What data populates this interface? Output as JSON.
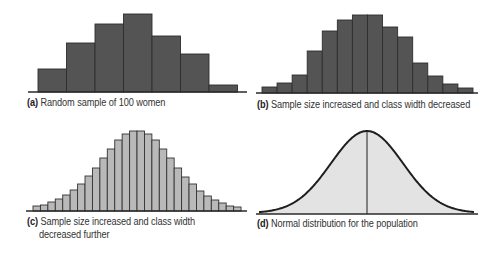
{
  "chart_data": [
    {
      "id": "a",
      "type": "bar",
      "panel_letter": "(a)",
      "caption": "Random sample of 100 women",
      "style": "histogram",
      "fill": "#545454",
      "stroke": "#2e2e2e",
      "baseline_y": 92,
      "baseline_x": [
        28,
        247
      ],
      "bar_x0": 38,
      "bar_width": 28.5,
      "bar_top_y": [
        69,
        43,
        24,
        14,
        36,
        54,
        85
      ],
      "values_relative": [
        23,
        49,
        68,
        78,
        56,
        38,
        7
      ],
      "grid": false,
      "xlabel": "",
      "ylabel": ""
    },
    {
      "id": "b",
      "type": "bar",
      "panel_letter": "(b)",
      "caption": "Sample size increased and class width decreased",
      "style": "histogram",
      "fill": "#545454",
      "stroke": "#2e2e2e",
      "baseline_y": 93,
      "baseline_x": [
        256,
        478
      ],
      "bar_x0": 262,
      "bar_width": 15.07,
      "bar_top_y": [
        87,
        83,
        75,
        51,
        31,
        20,
        15,
        15,
        27,
        37,
        63,
        76,
        84,
        88
      ],
      "values_relative": [
        6,
        10,
        18,
        42,
        62,
        73,
        78,
        78,
        66,
        56,
        30,
        17,
        9,
        5
      ],
      "grid": false,
      "xlabel": "",
      "ylabel": ""
    },
    {
      "id": "c",
      "type": "bar",
      "panel_letter": "(c)",
      "caption_line1": "Sample size increased and class width",
      "caption_line2": "decreased further",
      "style": "histogram",
      "fill": "#b9b9b9",
      "stroke": "#333333",
      "baseline_y": 211,
      "baseline_x": [
        26,
        247
      ],
      "bar_x0": 33,
      "bar_width": 7.43,
      "bar_top_y": [
        206,
        205,
        202,
        199,
        195,
        190,
        184,
        176,
        168,
        158,
        149,
        140,
        134,
        131,
        131,
        134,
        140,
        149,
        158,
        168,
        177,
        184,
        191,
        196,
        200,
        203,
        206,
        207
      ],
      "values_relative": [
        5,
        6,
        9,
        12,
        16,
        21,
        27,
        35,
        43,
        53,
        62,
        71,
        77,
        80,
        80,
        77,
        71,
        62,
        53,
        43,
        34,
        27,
        20,
        15,
        11,
        8,
        5,
        4
      ],
      "grid": false,
      "xlabel": "",
      "ylabel": ""
    },
    {
      "id": "d",
      "type": "area",
      "panel_letter": "(d)",
      "caption": "Normal distribution for the population",
      "style": "normal-curve",
      "fill": "#e3e3e3",
      "stroke": "#1e1e1e",
      "baseline_y": 214,
      "baseline_x": [
        256,
        478
      ],
      "curve_x": [
        259,
        474
      ],
      "mean_x": 367,
      "peak_y": 132,
      "sigma_px": 36,
      "mean_line": true,
      "grid": false,
      "xlabel": "",
      "ylabel": ""
    }
  ]
}
